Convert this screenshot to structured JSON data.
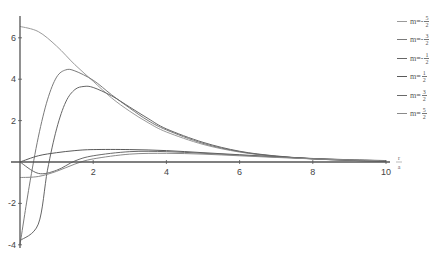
{
  "chart_data": {
    "type": "line",
    "title": "",
    "xlabel": "r/a",
    "ylabel": "",
    "xlim": [
      0,
      10.3
    ],
    "ylim": [
      -4.2,
      7.0
    ],
    "x_ticks": [
      2,
      4,
      6,
      8,
      10
    ],
    "y_ticks": [
      -4,
      -2,
      2,
      4,
      6
    ],
    "grid": false,
    "legend_position": "right",
    "series": [
      {
        "name": "m=-5/2",
        "label_prefix": "m=-",
        "num": "5",
        "den": "2",
        "color": "#9a9a9a",
        "x": [
          0,
          0.5,
          1,
          1.5,
          2,
          2.5,
          3,
          3.5,
          4,
          5,
          6,
          7,
          8,
          9,
          10
        ],
        "y": [
          6.55,
          6.3,
          5.6,
          4.7,
          3.9,
          3.1,
          2.45,
          1.9,
          1.45,
          0.85,
          0.48,
          0.27,
          0.15,
          0.08,
          0.04
        ]
      },
      {
        "name": "m=-3/2",
        "label_prefix": "m=-",
        "num": "3",
        "den": "2",
        "color": "#7a7a7a",
        "x": [
          0,
          0.25,
          0.5,
          0.75,
          1,
          1.25,
          1.5,
          2,
          2.5,
          3,
          3.5,
          4,
          5,
          6,
          7,
          8,
          9,
          10
        ],
        "y": [
          -4.0,
          -1.2,
          1.2,
          3.0,
          4.1,
          4.45,
          4.4,
          3.95,
          3.25,
          2.6,
          2.0,
          1.55,
          0.9,
          0.5,
          0.28,
          0.15,
          0.08,
          0.04
        ]
      },
      {
        "name": "m=-1/2",
        "label_prefix": "m=-",
        "num": "1",
        "den": "2",
        "color": "#666666",
        "x": [
          0,
          0.5,
          0.75,
          1,
          1.25,
          1.5,
          1.75,
          2,
          2.5,
          3,
          3.5,
          4,
          5,
          6,
          7,
          8,
          9,
          10
        ],
        "y": [
          -3.8,
          -3.0,
          -0.4,
          1.6,
          2.9,
          3.5,
          3.65,
          3.6,
          3.2,
          2.65,
          2.1,
          1.6,
          0.95,
          0.52,
          0.29,
          0.16,
          0.08,
          0.04
        ]
      },
      {
        "name": "m=1/2",
        "label_prefix": "m=",
        "num": "1",
        "den": "2",
        "color": "#5a5a5a",
        "x": [
          0,
          0.5,
          1,
          1.5,
          2,
          3,
          4,
          5,
          6,
          7,
          8,
          9,
          10
        ],
        "y": [
          0,
          0.3,
          0.45,
          0.55,
          0.6,
          0.6,
          0.55,
          0.45,
          0.35,
          0.25,
          0.17,
          0.11,
          0.07
        ]
      },
      {
        "name": "m=3/2",
        "label_prefix": "m=",
        "num": "3",
        "den": "2",
        "color": "#6a6a6a",
        "x": [
          0,
          0.5,
          1,
          1.5,
          2,
          3,
          4,
          5,
          6,
          7,
          8,
          9,
          10
        ],
        "y": [
          0,
          -0.55,
          -0.4,
          0.05,
          0.3,
          0.5,
          0.5,
          0.42,
          0.33,
          0.24,
          0.16,
          0.1,
          0.06
        ]
      },
      {
        "name": "m=5/2",
        "label_prefix": "m=",
        "num": "5",
        "den": "2",
        "color": "#8a8a8a",
        "x": [
          0,
          0.5,
          1,
          1.5,
          2,
          3,
          4,
          5,
          6,
          7,
          8,
          9,
          10
        ],
        "y": [
          -0.75,
          -0.7,
          -0.45,
          -0.1,
          0.15,
          0.38,
          0.42,
          0.38,
          0.3,
          0.22,
          0.15,
          0.1,
          0.06
        ]
      }
    ]
  },
  "axis": {
    "x_tick_labels": [
      "2",
      "4",
      "6",
      "8",
      "10"
    ],
    "y_tick_labels": [
      "-4",
      "-2",
      "2",
      "4",
      "6"
    ],
    "x_label_num": "r",
    "x_label_den": "a"
  }
}
